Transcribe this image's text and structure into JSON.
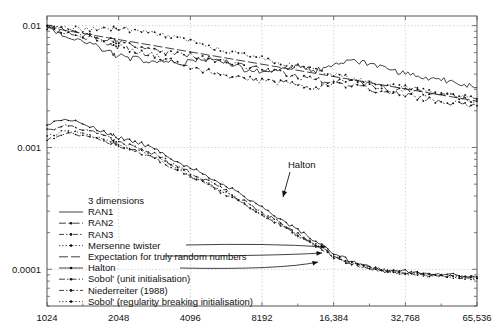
{
  "chart_data": {
    "type": "line",
    "title": "",
    "xlabel": "",
    "ylabel": "",
    "xscale": "log2",
    "yscale": "log10",
    "xlim": [
      1024,
      65536
    ],
    "ylim": [
      5e-05,
      0.012
    ],
    "grid": true,
    "xticks": [
      "1024",
      "2048",
      "4096",
      "8192",
      "16,384",
      "32,768",
      "65,536"
    ],
    "xtick_values": [
      1024,
      2048,
      4096,
      8192,
      16384,
      32768,
      65536
    ],
    "yticks": [
      "0.01",
      "0.001",
      "0.0001"
    ],
    "ytick_values": [
      0.01,
      0.001,
      0.0001
    ],
    "legend_title": "3 dimensions",
    "legend_position": "lower-left-inside",
    "series": [
      {
        "name": "RAN1",
        "style": "solid",
        "marker": "none",
        "x": [
          1024,
          1260,
          1550,
          1900,
          2048,
          2400,
          2900,
          3400,
          4096,
          4900,
          5800,
          6900,
          8192,
          9800,
          11600,
          13800,
          16384,
          19500,
          23200,
          27600,
          32768,
          39000,
          46400,
          55200,
          65536
        ],
        "values": [
          0.0098,
          0.0082,
          0.0072,
          0.006,
          0.0056,
          0.0053,
          0.0052,
          0.005,
          0.005,
          0.0054,
          0.005,
          0.0044,
          0.0042,
          0.0044,
          0.0046,
          0.0043,
          0.0047,
          0.0051,
          0.0048,
          0.0044,
          0.004,
          0.0038,
          0.0036,
          0.0034,
          0.0031
        ]
      },
      {
        "name": "RAN2",
        "style": "dashdot",
        "marker": "cross",
        "x": [
          1024,
          1260,
          1550,
          1900,
          2048,
          2400,
          2900,
          3400,
          4096,
          4900,
          5800,
          6900,
          8192,
          9800,
          11600,
          13800,
          16384,
          19500,
          23200,
          27600,
          32768,
          39000,
          46400,
          55200,
          65536
        ],
        "values": [
          0.0098,
          0.009,
          0.0081,
          0.0076,
          0.0074,
          0.0068,
          0.0062,
          0.0059,
          0.0058,
          0.0053,
          0.005,
          0.0046,
          0.0044,
          0.0041,
          0.0038,
          0.0036,
          0.0034,
          0.0032,
          0.003,
          0.0028,
          0.0027,
          0.0025,
          0.0024,
          0.0023,
          0.0022
        ]
      },
      {
        "name": "RAN3",
        "style": "dashdotdot",
        "marker": "square",
        "x": [
          1024,
          1260,
          1550,
          1900,
          2048,
          2400,
          2900,
          3400,
          4096,
          4900,
          5800,
          6900,
          8192,
          9800,
          11600,
          13800,
          16384,
          19500,
          23200,
          27600,
          32768,
          39000,
          46400,
          55200,
          65536
        ],
        "values": [
          0.0097,
          0.0086,
          0.0079,
          0.007,
          0.0067,
          0.0062,
          0.0057,
          0.0052,
          0.0046,
          0.0042,
          0.0039,
          0.0037,
          0.0035,
          0.0034,
          0.0033,
          0.0031,
          0.0034,
          0.0036,
          0.0033,
          0.003,
          0.0029,
          0.0028,
          0.0027,
          0.0026,
          0.0025
        ]
      },
      {
        "name": "Mersenne twister",
        "style": "dotted",
        "marker": "circle",
        "x": [
          1024,
          1260,
          1550,
          1900,
          2048,
          2400,
          2900,
          3400,
          4096,
          4900,
          5800,
          6900,
          8192,
          9800,
          11600,
          13800,
          16384,
          19500,
          23200,
          27600,
          32768,
          39000,
          46400,
          55200,
          65536
        ],
        "values": [
          0.0099,
          0.0095,
          0.0092,
          0.0094,
          0.0096,
          0.009,
          0.0086,
          0.008,
          0.0074,
          0.0068,
          0.0062,
          0.0058,
          0.0054,
          0.005,
          0.0046,
          0.0043,
          0.004,
          0.0037,
          0.0035,
          0.0033,
          0.0031,
          0.0029,
          0.0027,
          0.0026,
          0.0024
        ]
      },
      {
        "name": "Expectation for truly random numbers",
        "style": "longdash",
        "marker": "none",
        "x": [
          1024,
          65536
        ],
        "values": [
          0.0097,
          0.0024
        ]
      },
      {
        "name": "Halton",
        "style": "solid-dot",
        "marker": "dot",
        "x": [
          1024,
          1260,
          1550,
          1900,
          2048,
          2400,
          2900,
          3400,
          4096,
          4900,
          5800,
          6900,
          8192,
          9800,
          11600,
          13800,
          16384,
          19500,
          23200,
          27600,
          32768,
          39000,
          46400,
          55200,
          65536
        ],
        "values": [
          0.00155,
          0.00168,
          0.0015,
          0.00128,
          0.0012,
          0.00112,
          0.00098,
          0.00082,
          0.00068,
          0.00058,
          0.00048,
          0.0004,
          0.00032,
          0.00026,
          0.00021,
          0.00017,
          0.000135,
          0.000115,
          0.000104,
          9.9e-05,
          9.6e-05,
          9.3e-05,
          9.1e-05,
          8.9e-05,
          8.7e-05
        ]
      },
      {
        "name": "Sobol' (unit initialisation)",
        "style": "dashdot-dot",
        "marker": "dot",
        "x": [
          1024,
          1260,
          1550,
          1900,
          2048,
          2400,
          2900,
          3400,
          4096,
          4900,
          5800,
          6900,
          8192,
          9800,
          11600,
          13800,
          16384,
          19500,
          23200,
          27600,
          32768,
          39000,
          46400,
          55200,
          65536
        ],
        "values": [
          0.0014,
          0.00152,
          0.00135,
          0.00118,
          0.0011,
          0.001,
          0.00088,
          0.00074,
          0.00062,
          0.00052,
          0.00044,
          0.00036,
          0.00029,
          0.00024,
          0.000195,
          0.00016,
          0.00013,
          0.000112,
          0.000102,
          9.7e-05,
          9.4e-05,
          9.1e-05,
          8.9e-05,
          8.7e-05,
          8.5e-05
        ]
      },
      {
        "name": "Niederreiter (1988)",
        "style": "dashdot-sq",
        "marker": "dot",
        "x": [
          1024,
          1260,
          1550,
          1900,
          2048,
          2400,
          2900,
          3400,
          4096,
          4900,
          5800,
          6900,
          8192,
          9800,
          11600,
          13800,
          16384,
          19500,
          23200,
          27600,
          32768,
          39000,
          46400,
          55200,
          65536
        ],
        "values": [
          0.00118,
          0.0013,
          0.00122,
          0.0011,
          0.00104,
          0.00094,
          0.00082,
          0.0007,
          0.00058,
          0.00049,
          0.00041,
          0.00034,
          0.00028,
          0.00023,
          0.000188,
          0.000155,
          0.000126,
          0.00011,
          0.0001,
          9.6e-05,
          9.3e-05,
          9e-05,
          8.8e-05,
          8.6e-05,
          8.4e-05
        ]
      },
      {
        "name": "Sobol' (regularity breaking initialisation)",
        "style": "dotted-dot",
        "marker": "dot",
        "x": [
          1024,
          1260,
          1550,
          1900,
          2048,
          2400,
          2900,
          3400,
          4096,
          4900,
          5800,
          6900,
          8192,
          9800,
          11600,
          13800,
          16384,
          19500,
          23200,
          27600,
          32768,
          39000,
          46400,
          55200,
          65536
        ],
        "values": [
          0.00125,
          0.00138,
          0.00126,
          0.00112,
          0.00106,
          0.00096,
          0.00085,
          0.00072,
          0.0006,
          0.0005,
          0.00042,
          0.00035,
          0.000285,
          0.000235,
          0.00019,
          0.000158,
          0.000128,
          0.000111,
          0.000101,
          9.65e-05,
          9.35e-05,
          9.05e-05,
          8.85e-05,
          8.65e-05,
          8.45e-05
        ]
      }
    ],
    "annotations": [
      {
        "text": "Halton",
        "x": 288,
        "y": 168,
        "arrow_to_x": 283,
        "arrow_to_y": 197
      }
    ]
  },
  "legend": {
    "title": "3 dimensions",
    "entries": [
      {
        "label": "RAN1",
        "style": "solid"
      },
      {
        "label": "RAN2",
        "style": "dashdot"
      },
      {
        "label": "RAN3",
        "style": "dashdotdot"
      },
      {
        "label": "Mersenne twister",
        "style": "dotted"
      },
      {
        "label": "Expectation for truly random numbers",
        "style": "longdash"
      },
      {
        "label": "Halton",
        "style": "solid-dot"
      },
      {
        "label": "Sobol' (unit initialisation)",
        "style": "dashdot-dot"
      },
      {
        "label": "Niederreiter (1988)",
        "style": "dashdot-sq"
      },
      {
        "label": "Sobol' (regularity breaking initialisation)",
        "style": "dotted-dot"
      }
    ]
  },
  "colors": {
    "ink": "#111111",
    "frame": "#555555",
    "grid": "#bbbbbb",
    "background": "#ffffff"
  }
}
